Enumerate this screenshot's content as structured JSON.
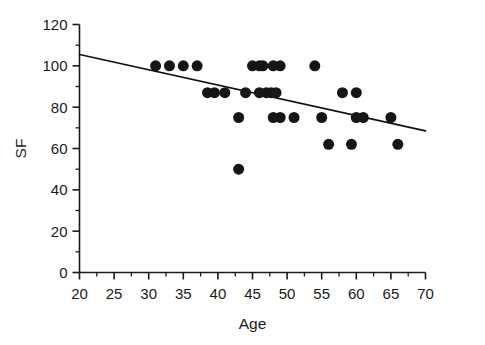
{
  "chart_data": {
    "type": "scatter",
    "title": "",
    "xlabel": "Age",
    "ylabel": "SF",
    "xlim": [
      20,
      70
    ],
    "ylim": [
      0,
      120
    ],
    "xticks": [
      20,
      25,
      30,
      35,
      40,
      45,
      50,
      55,
      60,
      65,
      70
    ],
    "yticks": [
      0,
      20,
      40,
      60,
      80,
      100,
      120
    ],
    "xtick_labels": [
      "20",
      "25",
      "30",
      "35",
      "40",
      "45",
      "50",
      "55",
      "60",
      "65",
      "70"
    ],
    "ytick_labels": [
      "0",
      "20",
      "40",
      "60",
      "80",
      "100",
      "120"
    ],
    "x_minor_tick_step": 2.5,
    "y_minor_tick_step": 10,
    "grid": false,
    "legend": false,
    "marker": "filled-circle",
    "marker_color": "#161616",
    "marker_size_px": 11,
    "points": [
      {
        "x": 31,
        "y": 100
      },
      {
        "x": 33,
        "y": 100
      },
      {
        "x": 35,
        "y": 100
      },
      {
        "x": 37,
        "y": 100
      },
      {
        "x": 38.5,
        "y": 87
      },
      {
        "x": 39.5,
        "y": 87
      },
      {
        "x": 41,
        "y": 87
      },
      {
        "x": 43,
        "y": 75
      },
      {
        "x": 43,
        "y": 50
      },
      {
        "x": 44,
        "y": 87
      },
      {
        "x": 45,
        "y": 100
      },
      {
        "x": 46,
        "y": 100
      },
      {
        "x": 46.5,
        "y": 100
      },
      {
        "x": 46,
        "y": 87
      },
      {
        "x": 47,
        "y": 87
      },
      {
        "x": 47.7,
        "y": 87
      },
      {
        "x": 48.4,
        "y": 87
      },
      {
        "x": 48,
        "y": 100
      },
      {
        "x": 49,
        "y": 100
      },
      {
        "x": 48,
        "y": 75
      },
      {
        "x": 49,
        "y": 75
      },
      {
        "x": 51,
        "y": 75
      },
      {
        "x": 54,
        "y": 100
      },
      {
        "x": 55,
        "y": 75
      },
      {
        "x": 56,
        "y": 62
      },
      {
        "x": 58,
        "y": 87
      },
      {
        "x": 59.3,
        "y": 62
      },
      {
        "x": 60,
        "y": 87
      },
      {
        "x": 60,
        "y": 75
      },
      {
        "x": 61,
        "y": 75
      },
      {
        "x": 65,
        "y": 75
      },
      {
        "x": 66,
        "y": 62
      }
    ],
    "fit_line": {
      "type": "linear-regression",
      "x_start": 20,
      "y_start": 105.5,
      "x_end": 70,
      "y_end": 68.5,
      "color": "#111111"
    }
  },
  "axes": {
    "x_title": "Age",
    "y_title": "SF"
  }
}
